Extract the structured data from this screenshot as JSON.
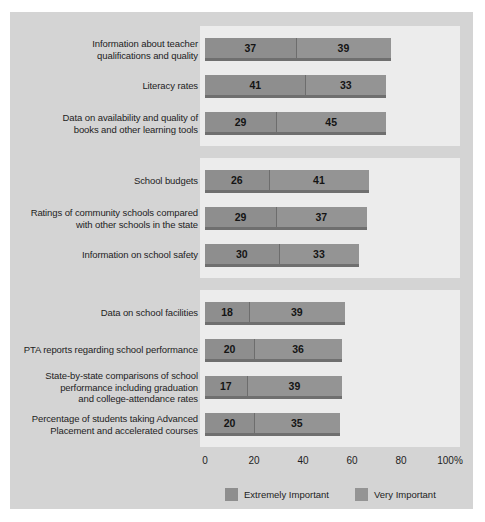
{
  "chart_data": {
    "type": "bar",
    "orientation": "horizontal",
    "stacked": true,
    "title": "",
    "subtitle": "",
    "xlabel": "",
    "ylabel": "",
    "xlim": [
      0,
      100
    ],
    "xticks": [
      0,
      20,
      40,
      60,
      80,
      100
    ],
    "xticklabels": [
      "0",
      "20",
      "40",
      "60",
      "80",
      "100%"
    ],
    "grid": false,
    "legend_position": "bottom",
    "legend": [
      {
        "name": "Extremely Important",
        "color": "#8e8e8e"
      },
      {
        "name": "Very Important",
        "color": "#949494"
      }
    ],
    "series": [
      {
        "name": "Extremely Important",
        "color": "#8e8e8e"
      },
      {
        "name": "Very Important",
        "color": "#949494"
      }
    ],
    "groups": [
      {
        "group_index": 1,
        "categories": [
          "Information about teacher qualifications and quality",
          "Literacy rates",
          "Data on availability and quality of books and other learning tools"
        ],
        "values": [
          [
            37,
            39
          ],
          [
            41,
            33
          ],
          [
            29,
            45
          ]
        ]
      },
      {
        "group_index": 2,
        "categories": [
          "School budgets",
          "Ratings of community schools compared with other schools in the state",
          "Information on school safety"
        ],
        "values": [
          [
            26,
            41
          ],
          [
            29,
            37
          ],
          [
            30,
            33
          ]
        ]
      },
      {
        "group_index": 3,
        "categories": [
          "Data on school facilities",
          "PTA reports regarding school performance",
          "State-by-state comparisons of school performance including graduation and college-attendance rates",
          "Percentage of students taking Advanced Placement and accelerated courses"
        ],
        "values": [
          [
            18,
            39
          ],
          [
            20,
            36
          ],
          [
            17,
            39
          ],
          [
            20,
            35
          ]
        ]
      }
    ],
    "categories": [
      "Information about teacher qualifications and quality",
      "Literacy rates",
      "Data on availability and quality of books and other learning tools",
      "School budgets",
      "Ratings of community schools compared with other schools in the state",
      "Information on school safety",
      "Data on school facilities",
      "PTA reports regarding school performance",
      "State-by-state comparisons of school performance including graduation and college-attendance rates",
      "Percentage of students taking Advanced Placement and accelerated courses"
    ],
    "values": [
      [
        37,
        39
      ],
      [
        41,
        33
      ],
      [
        29,
        45
      ],
      [
        26,
        41
      ],
      [
        29,
        37
      ],
      [
        30,
        33
      ],
      [
        18,
        39
      ],
      [
        20,
        36
      ],
      [
        17,
        39
      ],
      [
        20,
        35
      ]
    ]
  },
  "rows": [
    {
      "label_lines": [
        "Information about teacher",
        "qualifications and quality"
      ],
      "extremely": 37,
      "very": 39,
      "group": 1
    },
    {
      "label_lines": [
        "Literacy rates"
      ],
      "extremely": 41,
      "very": 33,
      "group": 1
    },
    {
      "label_lines": [
        "Data on availability and quality of",
        "books and other learning tools"
      ],
      "extremely": 29,
      "very": 45,
      "group": 1
    },
    {
      "label_lines": [
        "School budgets"
      ],
      "extremely": 26,
      "very": 41,
      "group": 2
    },
    {
      "label_lines": [
        "Ratings of community schools compared",
        "with other schools in the state"
      ],
      "extremely": 29,
      "very": 37,
      "group": 2
    },
    {
      "label_lines": [
        "Information on school safety"
      ],
      "extremely": 30,
      "very": 33,
      "group": 2
    },
    {
      "label_lines": [
        "Data on school facilities"
      ],
      "extremely": 18,
      "very": 39,
      "group": 3
    },
    {
      "label_lines": [
        "PTA reports regarding school performance"
      ],
      "extremely": 20,
      "very": 36,
      "group": 3
    },
    {
      "label_lines": [
        "State-by-state comparisons of school",
        "performance including graduation",
        "and college-attendance rates"
      ],
      "extremely": 17,
      "very": 39,
      "group": 3
    },
    {
      "label_lines": [
        "Percentage of students taking Advanced",
        "Placement and accelerated courses"
      ],
      "extremely": 20,
      "very": 35,
      "group": 3
    }
  ],
  "axis": {
    "ticks": [
      "0",
      "20",
      "40",
      "60",
      "80",
      "100%"
    ],
    "tick_values": [
      0,
      20,
      40,
      60,
      80,
      100
    ]
  },
  "legend": {
    "items": [
      {
        "label": "Extremely Important",
        "color": "#8e8e8e"
      },
      {
        "label": "Very Important",
        "color": "#949494"
      }
    ]
  },
  "colors": {
    "card_background": "#d4d4d4",
    "panel_background": "#ececec",
    "segment_extremely": "#8e8e8e",
    "segment_very": "#949494",
    "shadow": "#6f6f6f",
    "text": "#1d1d1d"
  }
}
